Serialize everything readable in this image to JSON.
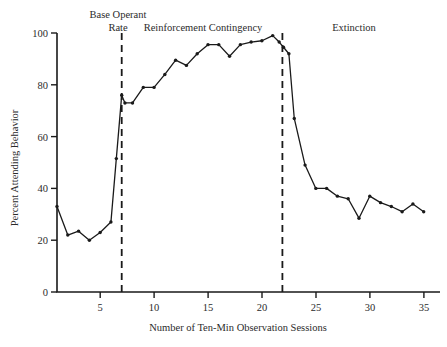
{
  "chart_data": {
    "type": "line",
    "title": "",
    "xlabel": "Number of Ten-Min Observation Sessions",
    "ylabel": "Percent Attending Behavior",
    "xlim": [
      1,
      36
    ],
    "ylim": [
      0,
      100
    ],
    "grid": false,
    "legend": "none",
    "x_ticks": [
      5,
      10,
      15,
      20,
      25,
      30,
      35
    ],
    "y_ticks": [
      0,
      20,
      40,
      60,
      80,
      100
    ],
    "x": [
      1,
      2,
      3,
      4,
      5,
      6,
      6.5,
      7,
      7.3,
      8,
      9,
      10,
      11,
      12,
      13,
      14,
      15,
      16,
      17,
      18,
      19,
      20,
      21,
      21.6,
      22,
      22.5,
      23,
      24,
      25,
      26,
      27,
      28,
      29,
      30,
      31,
      32,
      33,
      34,
      35
    ],
    "values": [
      33,
      22,
      23.5,
      20,
      23,
      27,
      51.5,
      76,
      73,
      73,
      79,
      79,
      84,
      89.5,
      87.5,
      92,
      95.5,
      95.5,
      91,
      95.5,
      96.5,
      97,
      99,
      96.5,
      94.5,
      92,
      67,
      49,
      40,
      40,
      37,
      36,
      28.5,
      37,
      34.5,
      33,
      31,
      34,
      31
    ],
    "annotations": [
      {
        "label": "Base Operant Rate",
        "x_range": [
          1,
          7
        ]
      },
      {
        "label": "Reinforcement Contingency",
        "x_range": [
          7,
          21.9
        ]
      },
      {
        "label": "Extinction",
        "x_range": [
          21.9,
          36
        ]
      }
    ],
    "phase_dividers": [
      7,
      21.9
    ]
  },
  "axes": {
    "y_label": "Percent Attending Behavior",
    "x_label": "Number of Ten-Min Observation Sessions",
    "y_tick_labels": [
      "0",
      "20",
      "40",
      "60",
      "80",
      "100"
    ],
    "x_tick_labels": [
      "5",
      "10",
      "15",
      "20",
      "25",
      "30",
      "35"
    ]
  },
  "phases": [
    {
      "line1": "Base Operant",
      "line2": "Rate"
    },
    {
      "line1": "Reinforcement Contingency",
      "line2": ""
    },
    {
      "line1": "Extinction",
      "line2": ""
    }
  ],
  "colors": {
    "ink": "#1a1a1a",
    "text": "#2b2b2b",
    "background": "#ffffff"
  }
}
